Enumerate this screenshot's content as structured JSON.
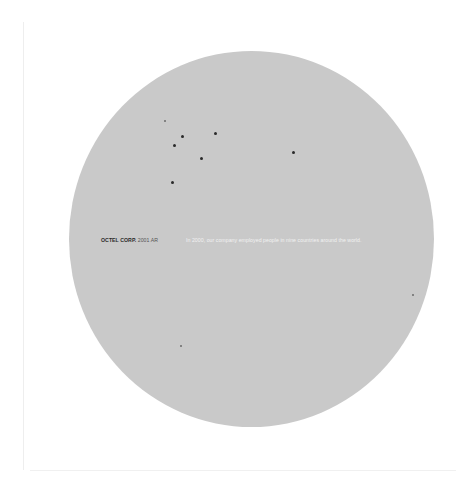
{
  "cover": {
    "brand_name": "OCTEL CORP.",
    "report_label": "2001 AR",
    "statement": "In 2000, our company employed people in nine countries around the world."
  },
  "colors": {
    "background": "#ffffff",
    "disc": "#c9c9c9",
    "dot": "#2a2a2a",
    "statement_text": "#f2f2f2",
    "brand_text": "#2a2a2a"
  },
  "dots": [
    {
      "x": 165,
      "y": 121,
      "style": "faint"
    },
    {
      "x": 182,
      "y": 136,
      "style": "solid"
    },
    {
      "x": 174,
      "y": 145,
      "style": "solid"
    },
    {
      "x": 215,
      "y": 133,
      "style": "solid"
    },
    {
      "x": 201,
      "y": 158,
      "style": "solid"
    },
    {
      "x": 172,
      "y": 182,
      "style": "solid"
    },
    {
      "x": 293,
      "y": 152,
      "style": "solid"
    },
    {
      "x": 413,
      "y": 295,
      "style": "faint"
    },
    {
      "x": 181,
      "y": 346,
      "style": "faint"
    }
  ]
}
